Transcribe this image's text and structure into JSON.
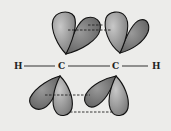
{
  "diagram": {
    "type": "molecular-orbital",
    "atoms": [
      {
        "id": "h1",
        "label": "H"
      },
      {
        "id": "c1",
        "label": "C"
      },
      {
        "id": "c2",
        "label": "C"
      },
      {
        "id": "h2",
        "label": "H"
      }
    ],
    "bonds": [
      {
        "from": "h1",
        "to": "c1"
      },
      {
        "from": "c1",
        "to": "c2"
      },
      {
        "from": "c2",
        "to": "h2"
      }
    ],
    "orbital_groups": [
      {
        "position": "above",
        "lobes": 4,
        "overlap_lines": 2
      },
      {
        "position": "below",
        "lobes": 4,
        "overlap_lines": 2
      }
    ],
    "colors": {
      "background": "#ececea",
      "lobe_light": "#a8a8a8",
      "lobe_dark": "#6e6e6e",
      "outline": "#111111"
    }
  }
}
